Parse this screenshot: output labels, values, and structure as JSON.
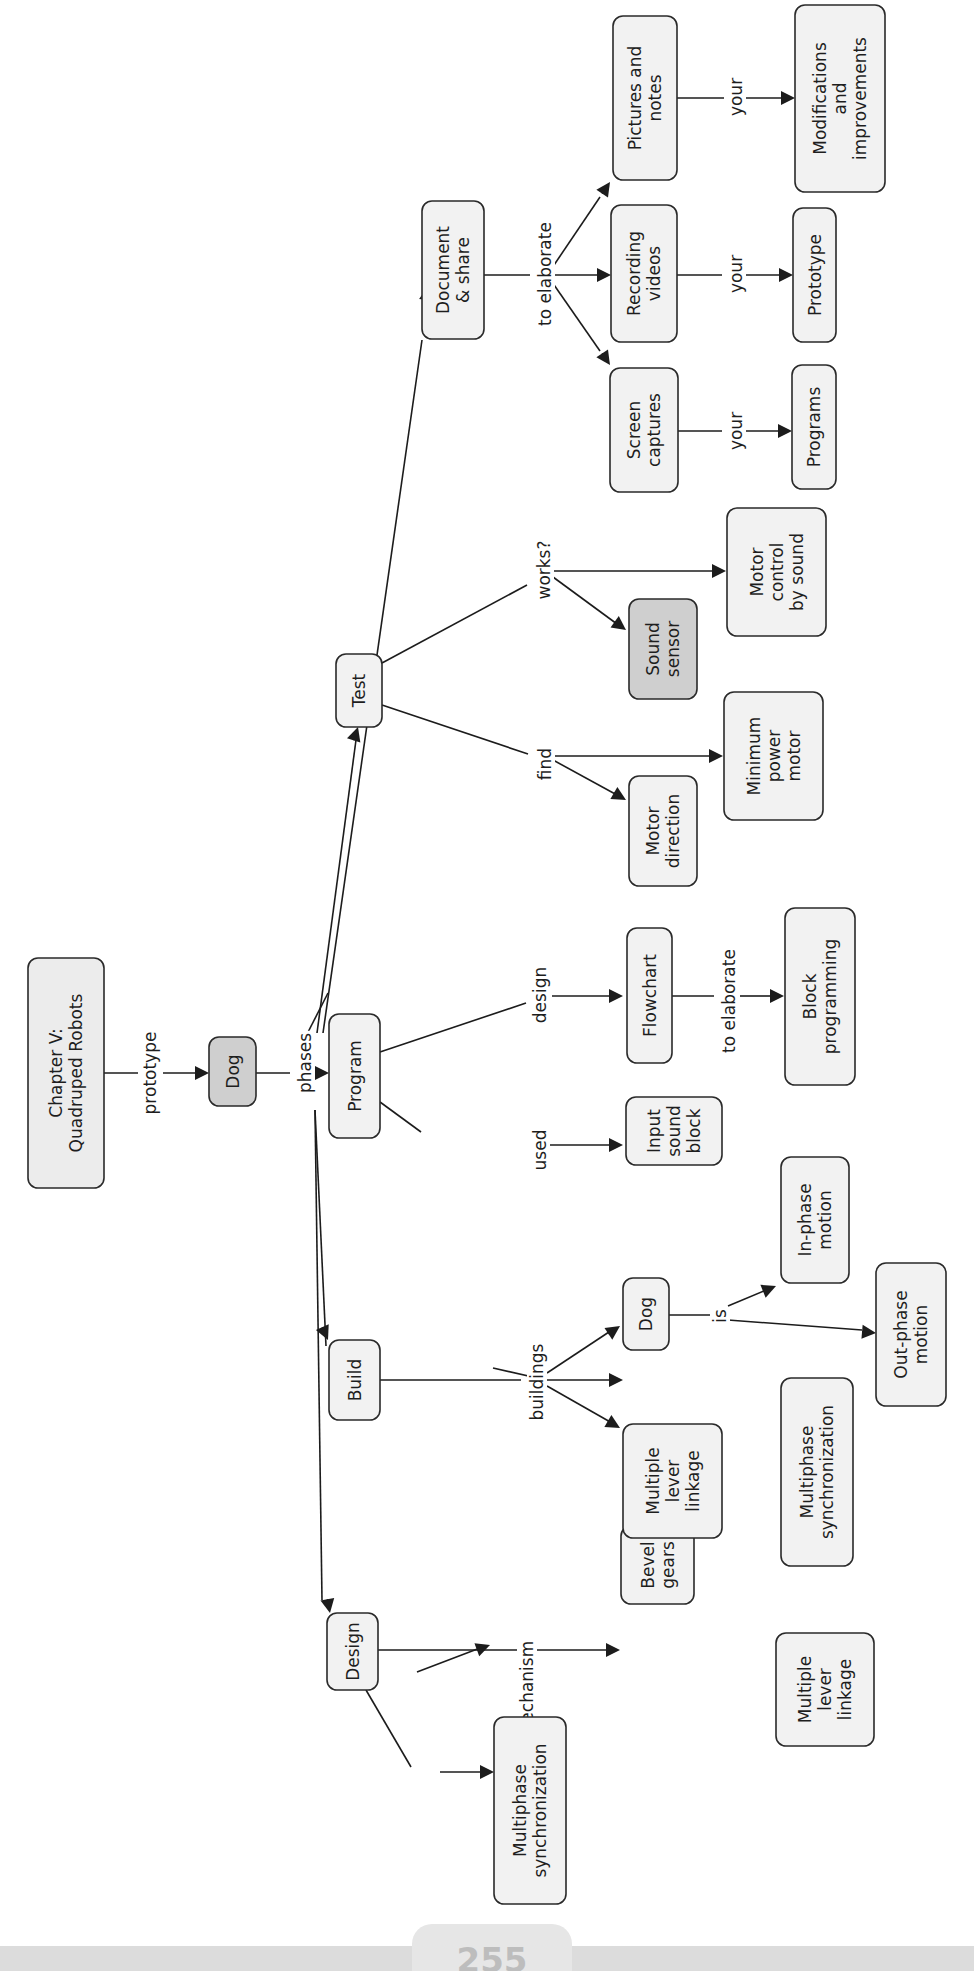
{
  "page": {
    "number": "255"
  },
  "colors": {
    "node_fill": "#f2f2f2",
    "node_fill_highlight": "#cfcfcf",
    "stroke": "#2a2a2a",
    "band": "#dcdcdc"
  },
  "diagram": {
    "nodes": [
      {
        "id": "chapter",
        "lines": [
          "Chapter V:",
          "Quadruped Robots"
        ],
        "x": 28,
        "y": 958,
        "w": 76,
        "h": 230,
        "fill": "#ececec"
      },
      {
        "id": "dog-root",
        "lines": [
          "Dog"
        ],
        "x": 209,
        "y": 1037,
        "w": 47,
        "h": 69,
        "fill": "#cfcfcf"
      },
      {
        "id": "design",
        "lines": [
          "Design"
        ],
        "x": 327,
        "y": 1613,
        "w": 51,
        "h": 77,
        "fill": "#f2f2f2"
      },
      {
        "id": "build",
        "lines": [
          "Build"
        ],
        "x": 329,
        "y": 1340,
        "w": 51,
        "h": 80,
        "fill": "#f2f2f2"
      },
      {
        "id": "program",
        "lines": [
          "Program"
        ],
        "x": 329,
        "y": 1014,
        "w": 51,
        "h": 124,
        "fill": "#f2f2f2"
      },
      {
        "id": "test",
        "lines": [
          "Test"
        ],
        "x": 336,
        "y": 654,
        "w": 46,
        "h": 73,
        "fill": "#f2f2f2"
      },
      {
        "id": "document-share",
        "lines": [
          "Document",
          "& share"
        ],
        "x": 422,
        "y": 201,
        "w": 62,
        "h": 138,
        "fill": "#f2f2f2"
      },
      {
        "id": "design-multiphase-sync",
        "lines": [
          "Multiphase",
          "synchronization"
        ],
        "x": 494,
        "y": 1717,
        "w": 72,
        "h": 187,
        "fill": "#f2f2f2"
      },
      {
        "id": "design-bevel-gears",
        "lines": [
          "Bevel",
          "gears"
        ],
        "x": 621,
        "y": 1526,
        "w": 73,
        "h": 78,
        "fill": "#f2f2f2"
      },
      {
        "id": "design-multiple-lever",
        "lines": [
          "Multiple",
          "lever",
          "linkage"
        ],
        "x": 776,
        "y": 1633,
        "w": 98,
        "h": 113,
        "fill": "#f2f2f2"
      },
      {
        "id": "build-multiple-lever",
        "lines": [
          "Multiple",
          "lever",
          "linkage"
        ],
        "x": 623,
        "y": 1424,
        "w": 99,
        "h": 114,
        "fill": "#f2f2f2"
      },
      {
        "id": "build-dog",
        "lines": [
          "Dog"
        ],
        "x": 623,
        "y": 1278,
        "w": 46,
        "h": 72,
        "fill": "#f2f2f2"
      },
      {
        "id": "build-multiphase-sync",
        "lines": [
          "Multiphase",
          "synchronization"
        ],
        "x": 781,
        "y": 1378,
        "w": 72,
        "h": 188,
        "fill": "#f2f2f2"
      },
      {
        "id": "in-phase-motion",
        "lines": [
          "In-phase",
          "motion"
        ],
        "x": 781,
        "y": 1157,
        "w": 68,
        "h": 126,
        "fill": "#f2f2f2"
      },
      {
        "id": "out-phase-motion",
        "lines": [
          "Out-phase",
          "motion"
        ],
        "x": 876,
        "y": 1263,
        "w": 70,
        "h": 143,
        "fill": "#f2f2f2"
      },
      {
        "id": "input-sound-block",
        "lines": [
          "Input",
          "sound",
          "block"
        ],
        "x": 626,
        "y": 1097,
        "w": 96,
        "h": 68,
        "fill": "#f2f2f2"
      },
      {
        "id": "flowchart",
        "lines": [
          "Flowchart"
        ],
        "x": 627,
        "y": 928,
        "w": 45,
        "h": 135,
        "fill": "#f2f2f2"
      },
      {
        "id": "block-programming",
        "lines": [
          "Block",
          "programming"
        ],
        "x": 785,
        "y": 908,
        "w": 70,
        "h": 177,
        "fill": "#f2f2f2"
      },
      {
        "id": "motor-direction",
        "lines": [
          "Motor",
          "direction"
        ],
        "x": 629,
        "y": 776,
        "w": 68,
        "h": 110,
        "fill": "#f2f2f2"
      },
      {
        "id": "minimum-power-motor",
        "lines": [
          "Minimum",
          "power",
          "motor"
        ],
        "x": 724,
        "y": 692,
        "w": 99,
        "h": 128,
        "fill": "#f2f2f2"
      },
      {
        "id": "sound-sensor",
        "lines": [
          "Sound",
          "sensor"
        ],
        "x": 629,
        "y": 599,
        "w": 68,
        "h": 100,
        "fill": "#cfcfcf"
      },
      {
        "id": "motor-control-by-sound",
        "lines": [
          "Motor",
          "control",
          "by sound"
        ],
        "x": 727,
        "y": 508,
        "w": 99,
        "h": 128,
        "fill": "#f2f2f2"
      },
      {
        "id": "screen-captures",
        "lines": [
          "Screen",
          "captures"
        ],
        "x": 610,
        "y": 368,
        "w": 68,
        "h": 124,
        "fill": "#f2f2f2"
      },
      {
        "id": "recording-videos",
        "lines": [
          "Recording",
          "videos"
        ],
        "x": 611,
        "y": 205,
        "w": 66,
        "h": 137,
        "fill": "#f2f2f2"
      },
      {
        "id": "pictures-and-notes",
        "lines": [
          "Pictures and",
          "notes"
        ],
        "x": 613,
        "y": 16,
        "w": 64,
        "h": 164,
        "fill": "#f2f2f2"
      },
      {
        "id": "programs",
        "lines": [
          "Programs"
        ],
        "x": 792,
        "y": 365,
        "w": 44,
        "h": 124,
        "fill": "#f2f2f2"
      },
      {
        "id": "prototype",
        "lines": [
          "Prototype"
        ],
        "x": 793,
        "y": 208,
        "w": 43,
        "h": 134,
        "fill": "#f2f2f2"
      },
      {
        "id": "modifications-improvements",
        "lines": [
          "Modifications",
          "and",
          "improvements"
        ],
        "x": 795,
        "y": 5,
        "w": 90,
        "h": 187,
        "fill": "#f2f2f2"
      }
    ],
    "link_labels": [
      {
        "id": "prototype",
        "text": "prototype",
        "x": 150,
        "y": 1073
      },
      {
        "id": "phases",
        "text": "phases",
        "x": 305,
        "y": 1063
      },
      {
        "id": "concept",
        "text": "concept",
        "x": 527,
        "y": 1815
      },
      {
        "id": "mechanism",
        "text": "mechanism",
        "x": 527,
        "y": 1690
      },
      {
        "id": "buildings",
        "text": "buildings",
        "x": 537,
        "y": 1382
      },
      {
        "id": "is",
        "text": "is",
        "x": 720,
        "y": 1316
      },
      {
        "id": "used",
        "text": "used",
        "x": 540,
        "y": 1150
      },
      {
        "id": "design-label",
        "text": "design",
        "x": 540,
        "y": 995
      },
      {
        "id": "to-elaborate-program",
        "text": "to elaborate",
        "x": 729,
        "y": 1001
      },
      {
        "id": "find",
        "text": "find",
        "x": 545,
        "y": 764
      },
      {
        "id": "works",
        "text": "works?",
        "x": 544,
        "y": 570
      },
      {
        "id": "to-elaborate-doc",
        "text": "to elaborate",
        "x": 545,
        "y": 274
      },
      {
        "id": "your-1",
        "text": "your",
        "x": 736,
        "y": 431
      },
      {
        "id": "your-2",
        "text": "your",
        "x": 736,
        "y": 274
      },
      {
        "id": "your-3",
        "text": "your",
        "x": 736,
        "y": 97
      }
    ],
    "edges": [
      {
        "d": "M104,1073 L138,1073"
      },
      {
        "d": "M163,1073 L197,1073",
        "arrow": [
          209,
          1073,
          0
        ]
      },
      {
        "d": "M256,1073 L290,1073"
      },
      {
        "d": "M318,1073 L317,1073",
        "arrow": [
          329,
          1073,
          0
        ]
      },
      {
        "d": "M304,1040 L328,993",
        "none": true
      },
      {
        "d": "M323,1033 L422,340",
        "arrow": [
          428,
          286,
          -82
        ]
      },
      {
        "d": "M317,1033 L356,740",
        "arrow": [
          358,
          727,
          -72
        ]
      },
      {
        "d": "M315,1110 L326,1346",
        "arrow": [
          328,
          1340,
          66
        ]
      },
      {
        "d": "M315,1110 L322,1600",
        "arrow": [
          330,
          1613,
          79
        ]
      },
      {
        "d": "M378,1650 L512,1650 L607,1650",
        "arrow": [
          620,
          1650,
          0
        ]
      },
      {
        "d": "M366,1690 L411,1767"
      },
      {
        "d": "M440,1772 L481,1772",
        "arrow": [
          494,
          1772,
          0
        ]
      },
      {
        "d": "M417,1672 L480,1648",
        "arrow": [
          490,
          1645,
          -20
        ]
      },
      {
        "d": "M380,1380 L521,1380"
      },
      {
        "d": "M546,1380 L611,1380",
        "arrow": [
          623,
          1380,
          0
        ]
      },
      {
        "d": "M546,1380 L530,1380"
      },
      {
        "d": "M546,1380 L493,1368",
        "none": true
      },
      {
        "d": "M547,1386 L612,1423",
        "arrow": [
          620,
          1428,
          30
        ]
      },
      {
        "d": "M547,1373 L612,1330",
        "arrow": [
          620,
          1326,
          -34
        ]
      },
      {
        "d": "M669,1315 L711,1315"
      },
      {
        "d": "M728,1320 L862,1330",
        "arrow": [
          876,
          1333,
          5
        ]
      },
      {
        "d": "M728,1306 L764,1291",
        "arrow": [
          776,
          1286,
          -22
        ]
      },
      {
        "d": "M380,1102 L421,1132"
      },
      {
        "d": "M550,1145 L611,1145",
        "arrow": [
          623,
          1145,
          0
        ]
      },
      {
        "d": "M380,1052 L526,1003",
        "none": true
      },
      {
        "d": "M552,996 L611,996",
        "arrow": [
          623,
          996,
          0
        ]
      },
      {
        "d": "M672,996 L714,996"
      },
      {
        "d": "M740,996 L772,996",
        "arrow": [
          784,
          996,
          0
        ]
      },
      {
        "d": "M382,705 L528,754",
        "none": true
      },
      {
        "d": "M553,756 L716,756",
        "arrow": [
          723,
          756,
          0
        ]
      },
      {
        "d": "M553,760 L617,795",
        "arrow": [
          626,
          800,
          30
        ]
      },
      {
        "d": "M382,663 L527,585",
        "none": true
      },
      {
        "d": "M553,571 L717,571",
        "arrow": [
          726,
          571,
          0
        ]
      },
      {
        "d": "M553,577 L617,624",
        "arrow": [
          626,
          630,
          36
        ]
      },
      {
        "d": "M484,275 L530,275"
      },
      {
        "d": "M552,275 L597,275",
        "arrow": [
          611,
          275,
          0
        ]
      },
      {
        "d": "M552,268 L600,197",
        "arrow": [
          610,
          182,
          -56
        ]
      },
      {
        "d": "M552,282 L600,351",
        "arrow": [
          610,
          365,
          56
        ]
      },
      {
        "d": "M678,431 L722,431"
      },
      {
        "d": "M744,431 L780,431",
        "arrow": [
          792,
          431,
          0
        ]
      },
      {
        "d": "M677,275 L722,275"
      },
      {
        "d": "M744,275 L780,275",
        "arrow": [
          793,
          275,
          0
        ]
      },
      {
        "d": "M677,98 L724,98"
      },
      {
        "d": "M746,98 L782,98",
        "arrow": [
          795,
          98,
          0
        ]
      }
    ]
  }
}
